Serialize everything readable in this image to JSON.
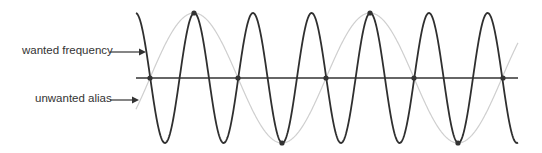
{
  "labels": {
    "wanted": "wanted frequency",
    "alias": "unwanted alias"
  },
  "colors": {
    "wanted_wave": "#2f2f2f",
    "alias_wave": "#cfcfcf",
    "axis": "#333333",
    "text": "#333333",
    "sample_dot": "#333333"
  },
  "geometry": {
    "axis_y": 78,
    "x_start": 136,
    "x_end": 518,
    "amplitude": 65,
    "wanted_period": 58.67,
    "alias_period": 176,
    "alias_zero_x": 150,
    "wanted_peak_x": 135.6
  },
  "sample_points": [
    {
      "x": 150,
      "y": 78
    },
    {
      "x": 194,
      "y": 13
    },
    {
      "x": 238,
      "y": 78
    },
    {
      "x": 282,
      "y": 143
    },
    {
      "x": 326,
      "y": 78
    },
    {
      "x": 370,
      "y": 13
    },
    {
      "x": 414,
      "y": 78
    },
    {
      "x": 458,
      "y": 143
    },
    {
      "x": 503,
      "y": 78
    }
  ]
}
